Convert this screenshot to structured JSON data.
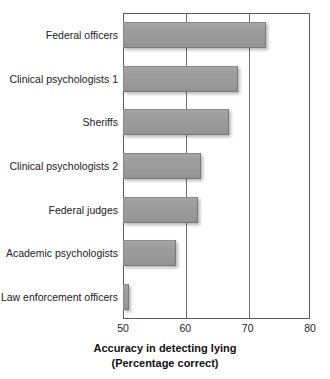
{
  "chart_data": {
    "type": "bar",
    "orientation": "horizontal",
    "title": "",
    "xlabel": "Accuracy in detecting lying (Percentage correct)",
    "xlabel_line1": "Accuracy in detecting lying",
    "xlabel_line2": "(Percentage correct)",
    "ylabel": "",
    "categories": [
      "Federal officers",
      "Clinical psychologists 1",
      "Sheriffs",
      "Clinical psychologists 2",
      "Federal judges",
      "Academic psychologists",
      "Law enforcement officers"
    ],
    "values": [
      73,
      68.5,
      67,
      62.5,
      62,
      58.5,
      51
    ],
    "xlim": [
      50,
      80
    ],
    "xticks": [
      50,
      60,
      70,
      80
    ],
    "xtick_labels": [
      "50",
      "60",
      "70",
      "80"
    ],
    "grid": "vertical",
    "legend": "none",
    "bar_color": "#9b9b9b",
    "bar_edge_color": "#808080",
    "axis_color": "#5d5d5d",
    "background": "#ffffff"
  }
}
